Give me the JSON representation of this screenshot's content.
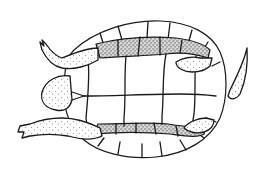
{
  "figure": {
    "style": "black ink line drawing with stippled skin",
    "colors": {
      "background": "#ffffff",
      "ink": "#1a1a1a"
    },
    "parts": [
      "head",
      "left-forelimb",
      "right-forelimb",
      "left-hindlimb",
      "right-hindlimb",
      "tail",
      "plastron-scutes",
      "marginal-scutes",
      "upper-bridge",
      "lower-bridge"
    ]
  }
}
